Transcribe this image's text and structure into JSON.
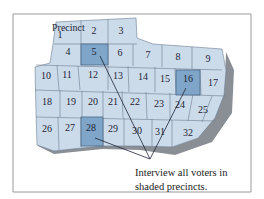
{
  "map": {
    "header_label": "Precinct",
    "precincts": [
      {
        "n": "1",
        "x": 60,
        "y": 35,
        "shaded": false
      },
      {
        "n": "2",
        "x": 94,
        "y": 31,
        "shaded": false
      },
      {
        "n": "3",
        "x": 121,
        "y": 31,
        "shaded": false
      },
      {
        "n": "4",
        "x": 68,
        "y": 52,
        "shaded": false
      },
      {
        "n": "5",
        "x": 94,
        "y": 52,
        "shaded": true
      },
      {
        "n": "6",
        "x": 120,
        "y": 53,
        "shaded": false
      },
      {
        "n": "7",
        "x": 148,
        "y": 55,
        "shaded": false
      },
      {
        "n": "8",
        "x": 178,
        "y": 57,
        "shaded": false
      },
      {
        "n": "9",
        "x": 208,
        "y": 59,
        "shaded": false
      },
      {
        "n": "10",
        "x": 46,
        "y": 76,
        "shaded": false
      },
      {
        "n": "11",
        "x": 67,
        "y": 75,
        "shaded": false
      },
      {
        "n": "12",
        "x": 93,
        "y": 75,
        "shaded": false
      },
      {
        "n": "13",
        "x": 118,
        "y": 76,
        "shaded": false
      },
      {
        "n": "14",
        "x": 143,
        "y": 77,
        "shaded": false
      },
      {
        "n": "15",
        "x": 165,
        "y": 79,
        "shaded": false
      },
      {
        "n": "16",
        "x": 188,
        "y": 79,
        "shaded": true
      },
      {
        "n": "17",
        "x": 213,
        "y": 83,
        "shaded": false
      },
      {
        "n": "18",
        "x": 47,
        "y": 102,
        "shaded": false
      },
      {
        "n": "19",
        "x": 71,
        "y": 102,
        "shaded": false
      },
      {
        "n": "20",
        "x": 93,
        "y": 102,
        "shaded": false
      },
      {
        "n": "21",
        "x": 113,
        "y": 102,
        "shaded": false
      },
      {
        "n": "22",
        "x": 135,
        "y": 102,
        "shaded": false
      },
      {
        "n": "23",
        "x": 159,
        "y": 104,
        "shaded": false
      },
      {
        "n": "24",
        "x": 180,
        "y": 105,
        "shaded": false
      },
      {
        "n": "25",
        "x": 203,
        "y": 110,
        "shaded": false
      },
      {
        "n": "26",
        "x": 47,
        "y": 129,
        "shaded": false
      },
      {
        "n": "27",
        "x": 70,
        "y": 128,
        "shaded": false
      },
      {
        "n": "28",
        "x": 91,
        "y": 128,
        "shaded": true
      },
      {
        "n": "29",
        "x": 113,
        "y": 129,
        "shaded": false
      },
      {
        "n": "30",
        "x": 137,
        "y": 131,
        "shaded": false
      },
      {
        "n": "31",
        "x": 160,
        "y": 132,
        "shaded": false
      },
      {
        "n": "32",
        "x": 188,
        "y": 133,
        "shaded": false
      }
    ],
    "colors": {
      "fill": "#ccdbea",
      "shaded": "#7fa6c9",
      "border": "#6b7d92",
      "shadow": "#8a8f96",
      "frame": "#9a9a9a"
    }
  },
  "caption": {
    "line1": "Interview all voters in",
    "line2": "shaded precincts."
  }
}
